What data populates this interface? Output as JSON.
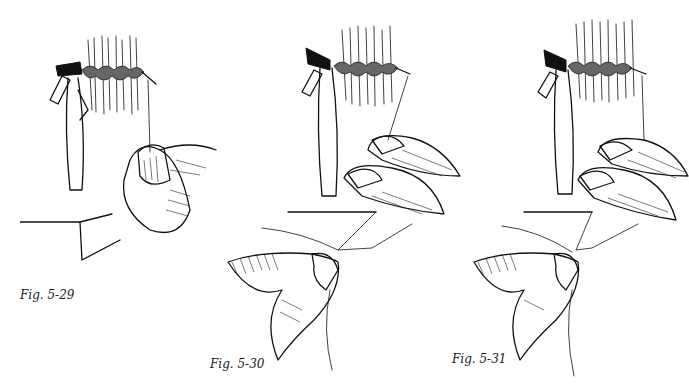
{
  "page": {
    "figures": [
      {
        "id": "5-29",
        "caption": "Fig. 5-29"
      },
      {
        "id": "5-30",
        "caption": "Fig. 5-30"
      },
      {
        "id": "5-31",
        "caption": "Fig. 5-31"
      }
    ]
  }
}
